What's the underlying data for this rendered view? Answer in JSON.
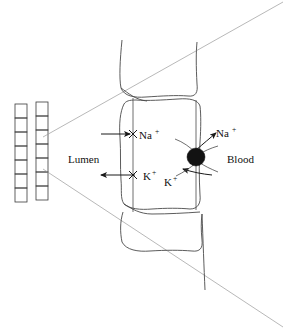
{
  "figure": {
    "type": "biological-schematic",
    "background_color": "#ffffff",
    "labels": {
      "lumen": "Lumen",
      "blood": "Blood",
      "sodium_apical": {
        "base": "Na",
        "sup": "+"
      },
      "sodium_basolateral": {
        "base": "Na",
        "sup": "+"
      },
      "potassium_apical": {
        "base": "K",
        "sup": "+"
      },
      "potassium_pump": {
        "base": "K",
        "sup": "+"
      }
    },
    "colors": {
      "outline": "#4a4a4a",
      "cone": "#9a9a9a",
      "arrow": "#1a1a1a",
      "pump": "#121212",
      "text": "#111111"
    },
    "tubule": {
      "description": "two parallel columns of stacked epithelial cells",
      "column_count": 2,
      "cells_per_column": 7
    },
    "magnification_cone": {
      "apex_top": [
        42,
        136
      ],
      "apex_bottom": [
        42,
        168
      ],
      "description": "wedge expanding to the right edge"
    },
    "transport": {
      "apical_sodium_direction": "into cell (rightward)",
      "apical_potassium_direction": "out of cell to lumen (leftward)",
      "pump_sodium_direction": "out of cell to blood (up-right)",
      "pump_potassium_direction": "into cell from blood (down-left)"
    }
  }
}
